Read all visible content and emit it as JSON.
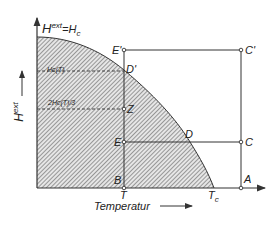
{
  "figure": {
    "curve_label": {
      "base": "H",
      "sup": "ext",
      "eq": "=H",
      "sub": "c"
    },
    "y_axis_label": {
      "base": "H",
      "sup": "ext"
    },
    "x_axis_label": "Temperatur",
    "points": {
      "E_prime": "E'",
      "C_prime": "C'",
      "D_prime": "D'",
      "Z": "Z",
      "E": "E",
      "D": "D",
      "C": "C",
      "B": "B",
      "A": "A"
    },
    "ticks": {
      "T": "T",
      "Tc": {
        "base": "T",
        "sub": "c"
      }
    },
    "dashed_labels": {
      "hc_t": "Hc(T)",
      "two_thirds_hc_t": "2Hc(T)/3"
    },
    "colors": {
      "line": "#333333",
      "hatch": "#555555",
      "background": "#ffffff"
    }
  }
}
